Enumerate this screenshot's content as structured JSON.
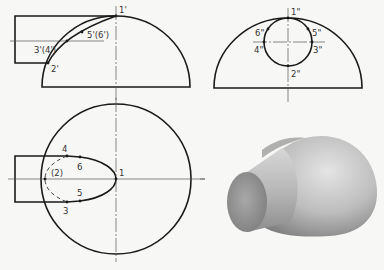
{
  "figure": {
    "views": {
      "front": {
        "labels": [
          "1'",
          "5'(6')",
          "3'(4')",
          "2'"
        ]
      },
      "side": {
        "labels": [
          "1\"",
          "6\"",
          "5\"",
          "4\"",
          "3\"",
          "2\""
        ]
      },
      "top": {
        "labels": [
          "4",
          "6",
          "(2)",
          "1",
          "5",
          "3"
        ]
      },
      "render": {
        "description": "Shaded 3D view of cylinder penetrating hemisphere"
      }
    },
    "colors": {
      "line": "#1a1a1a",
      "background": "#f7f7f5",
      "shade_light": "#e2e2e2",
      "shade_dark": "#8a8a8a"
    }
  }
}
